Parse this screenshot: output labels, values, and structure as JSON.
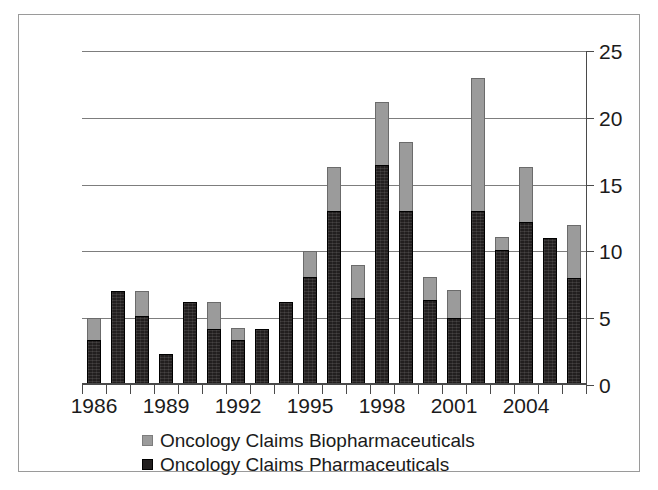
{
  "chart_data": {
    "type": "bar",
    "stacked": true,
    "title": "",
    "subtitle": "",
    "xlabel": "",
    "ylabel": "",
    "ylim": [
      0,
      25
    ],
    "yticks": [
      0,
      5,
      10,
      15,
      20,
      25
    ],
    "ytick_labels": [
      "0",
      "5",
      "10",
      "15",
      "20",
      "25"
    ],
    "grid": true,
    "grid_axis": "y",
    "legend_position": "bottom-left",
    "categories": [
      "1986",
      "1987",
      "1988",
      "1989",
      "1990",
      "1991",
      "1992",
      "1993",
      "1994",
      "1995",
      "1996",
      "1997",
      "1998",
      "1999",
      "2000",
      "2001",
      "2002",
      "2003",
      "2004",
      "2005",
      "2006"
    ],
    "xtick_labels_shown": [
      "1986",
      "1989",
      "1992",
      "1995",
      "1998",
      "2001",
      "2004"
    ],
    "xtick_label_positions": [
      0,
      3,
      6,
      9,
      12,
      15,
      18
    ],
    "series": [
      {
        "name": "Oncology Claims Pharmaceuticals",
        "color": "#221f1f",
        "values": [
          3.4,
          7.0,
          5.2,
          2.3,
          6.2,
          4.2,
          3.4,
          4.2,
          6.2,
          8.1,
          13.0,
          6.5,
          16.5,
          13.0,
          6.4,
          5.0,
          13.0,
          10.1,
          12.2,
          11.0,
          8.0
        ]
      },
      {
        "name": "Oncology Claims Biopharmaceuticals",
        "color": "#9b9b9b",
        "values": [
          1.6,
          0.0,
          1.8,
          0.0,
          0.0,
          2.0,
          0.9,
          0.0,
          0.0,
          1.9,
          3.3,
          2.5,
          4.7,
          5.2,
          1.7,
          2.1,
          10.0,
          1.0,
          4.1,
          0.0,
          4.0
        ]
      }
    ],
    "totals": [
      5.0,
      7.0,
      7.0,
      2.3,
      6.2,
      6.2,
      4.3,
      4.2,
      6.2,
      10.0,
      16.3,
      9.0,
      21.2,
      18.2,
      8.1,
      7.1,
      23.0,
      11.1,
      16.3,
      11.0,
      12.0
    ]
  },
  "legend": {
    "items": [
      {
        "label": "Oncology Claims Biopharmaceuticals",
        "swatch": "#9b9b9b"
      },
      {
        "label": "Oncology Claims Pharmaceuticals",
        "swatch": "#221f1f"
      }
    ]
  },
  "colors": {
    "biopharmaceuticals": "#9b9b9b",
    "pharmaceuticals": "#221f1f",
    "gridline": "#7d7d7d",
    "axis": "#4a4a4a",
    "frame": "#9a9a9a",
    "background": "#ffffff"
  }
}
